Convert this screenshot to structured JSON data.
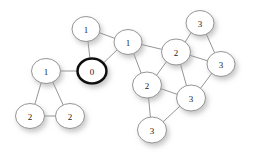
{
  "diagram": {
    "background_color": "#ffffff",
    "edge_color": "#7a7a7a",
    "node_fill": "#ffffff",
    "node_stroke": "#8a8a8a",
    "highlight_stroke": "#111111",
    "shadow_color": "#b9b9b9"
  },
  "nodes": [
    {
      "id": "n0",
      "label": "0",
      "cx": 92,
      "cy": 71,
      "rx": 14.5,
      "ry": 12.5,
      "highlight": true
    },
    {
      "id": "n1",
      "label": "1",
      "cx": 86,
      "cy": 29,
      "rx": 14.0,
      "ry": 12.5,
      "highlight": false
    },
    {
      "id": "n2",
      "label": "1",
      "cx": 128,
      "cy": 42,
      "rx": 14.0,
      "ry": 12.5,
      "highlight": false
    },
    {
      "id": "n3",
      "label": "1",
      "cx": 46,
      "cy": 71,
      "rx": 14.5,
      "ry": 12.5,
      "highlight": false
    },
    {
      "id": "n4",
      "label": "2",
      "cx": 30,
      "cy": 116,
      "rx": 14.5,
      "ry": 12.5,
      "highlight": false
    },
    {
      "id": "n5",
      "label": "2",
      "cx": 70,
      "cy": 116,
      "rx": 14.5,
      "ry": 12.5,
      "highlight": false
    },
    {
      "id": "n6",
      "label": "2",
      "cx": 176,
      "cy": 52,
      "rx": 14.5,
      "ry": 13.0,
      "highlight": false
    },
    {
      "id": "n7",
      "label": "2",
      "cx": 147,
      "cy": 85,
      "rx": 14.5,
      "ry": 13.0,
      "highlight": false
    },
    {
      "id": "n8",
      "label": "3",
      "cx": 200,
      "cy": 23,
      "rx": 14.0,
      "ry": 12.5,
      "highlight": false
    },
    {
      "id": "n9",
      "label": "3",
      "cx": 221,
      "cy": 64,
      "rx": 14.0,
      "ry": 12.5,
      "highlight": false
    },
    {
      "id": "n10",
      "label": "3",
      "cx": 191,
      "cy": 98,
      "rx": 14.5,
      "ry": 13.0,
      "highlight": false
    },
    {
      "id": "n11",
      "label": "3",
      "cx": 152,
      "cy": 130,
      "rx": 14.5,
      "ry": 13.0,
      "highlight": false
    }
  ],
  "edges": [
    {
      "from": "n0",
      "to": "n1"
    },
    {
      "from": "n0",
      "to": "n2"
    },
    {
      "from": "n0",
      "to": "n3"
    },
    {
      "from": "n1",
      "to": "n2"
    },
    {
      "from": "n2",
      "to": "n6"
    },
    {
      "from": "n2",
      "to": "n7"
    },
    {
      "from": "n3",
      "to": "n4"
    },
    {
      "from": "n3",
      "to": "n5"
    },
    {
      "from": "n4",
      "to": "n5"
    },
    {
      "from": "n6",
      "to": "n7"
    },
    {
      "from": "n6",
      "to": "n8"
    },
    {
      "from": "n6",
      "to": "n9"
    },
    {
      "from": "n6",
      "to": "n10"
    },
    {
      "from": "n7",
      "to": "n10"
    },
    {
      "from": "n7",
      "to": "n11"
    },
    {
      "from": "n8",
      "to": "n9"
    },
    {
      "from": "n9",
      "to": "n10"
    },
    {
      "from": "n10",
      "to": "n11"
    }
  ]
}
